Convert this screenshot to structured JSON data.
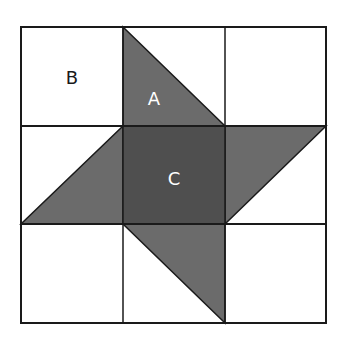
{
  "diagram": {
    "title": "",
    "grid": {
      "rows": 3,
      "cols": 3,
      "x": [
        21,
        123,
        225,
        326
      ],
      "y": [
        27,
        126,
        224,
        323
      ]
    },
    "colors": {
      "background": "#ffffff",
      "line": "#1a1a1a",
      "triangle_fill": "#6b6b6b",
      "center_fill": "#4f4f4f",
      "label_dark": "#1a1a1a",
      "label_light": "#ffffff"
    },
    "shapes": [
      {
        "id": "triangle-top",
        "type": "triangle",
        "points": "123,27 123,126 225,126"
      },
      {
        "id": "triangle-right",
        "type": "triangle",
        "points": "225,126 326,126 225,224"
      },
      {
        "id": "triangle-bottom",
        "type": "triangle",
        "points": "123,224 225,224 225,323"
      },
      {
        "id": "triangle-left",
        "type": "triangle",
        "points": "123,126 123,224 21,224"
      },
      {
        "id": "center-square",
        "type": "square",
        "points": "123,126 225,126 225,224 123,224"
      }
    ],
    "labels": {
      "B": "B",
      "A": "A",
      "C": "C"
    }
  }
}
